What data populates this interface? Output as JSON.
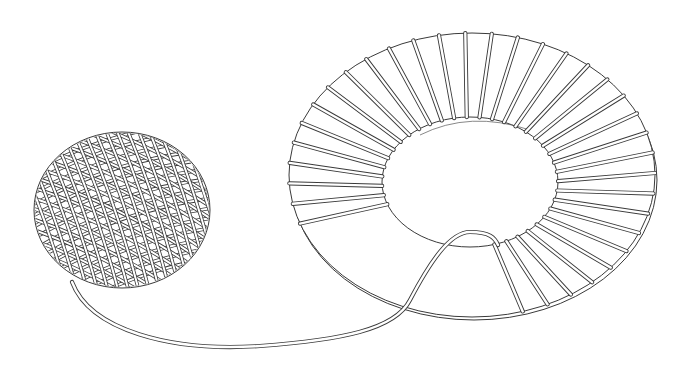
{
  "figure": {
    "description": "Line drawing of a ball of string connected by a loose strand to a toroidal ring wound with string",
    "background": "#ffffff",
    "stroke_color": "#3a3a3a",
    "objects": [
      {
        "name": "ball-of-string",
        "center": [
          122,
          210
        ],
        "rx": 88,
        "ry": 78
      },
      {
        "name": "toroid",
        "outer_center": [
          472,
          175
        ],
        "outer_rx": 183,
        "outer_ry": 142,
        "inner_center": [
          470,
          182
        ],
        "inner_rx": 88,
        "inner_ry": 65,
        "winding_count": 30
      },
      {
        "name": "string-strand",
        "from": "ball-of-string",
        "to": "toroid"
      }
    ]
  }
}
